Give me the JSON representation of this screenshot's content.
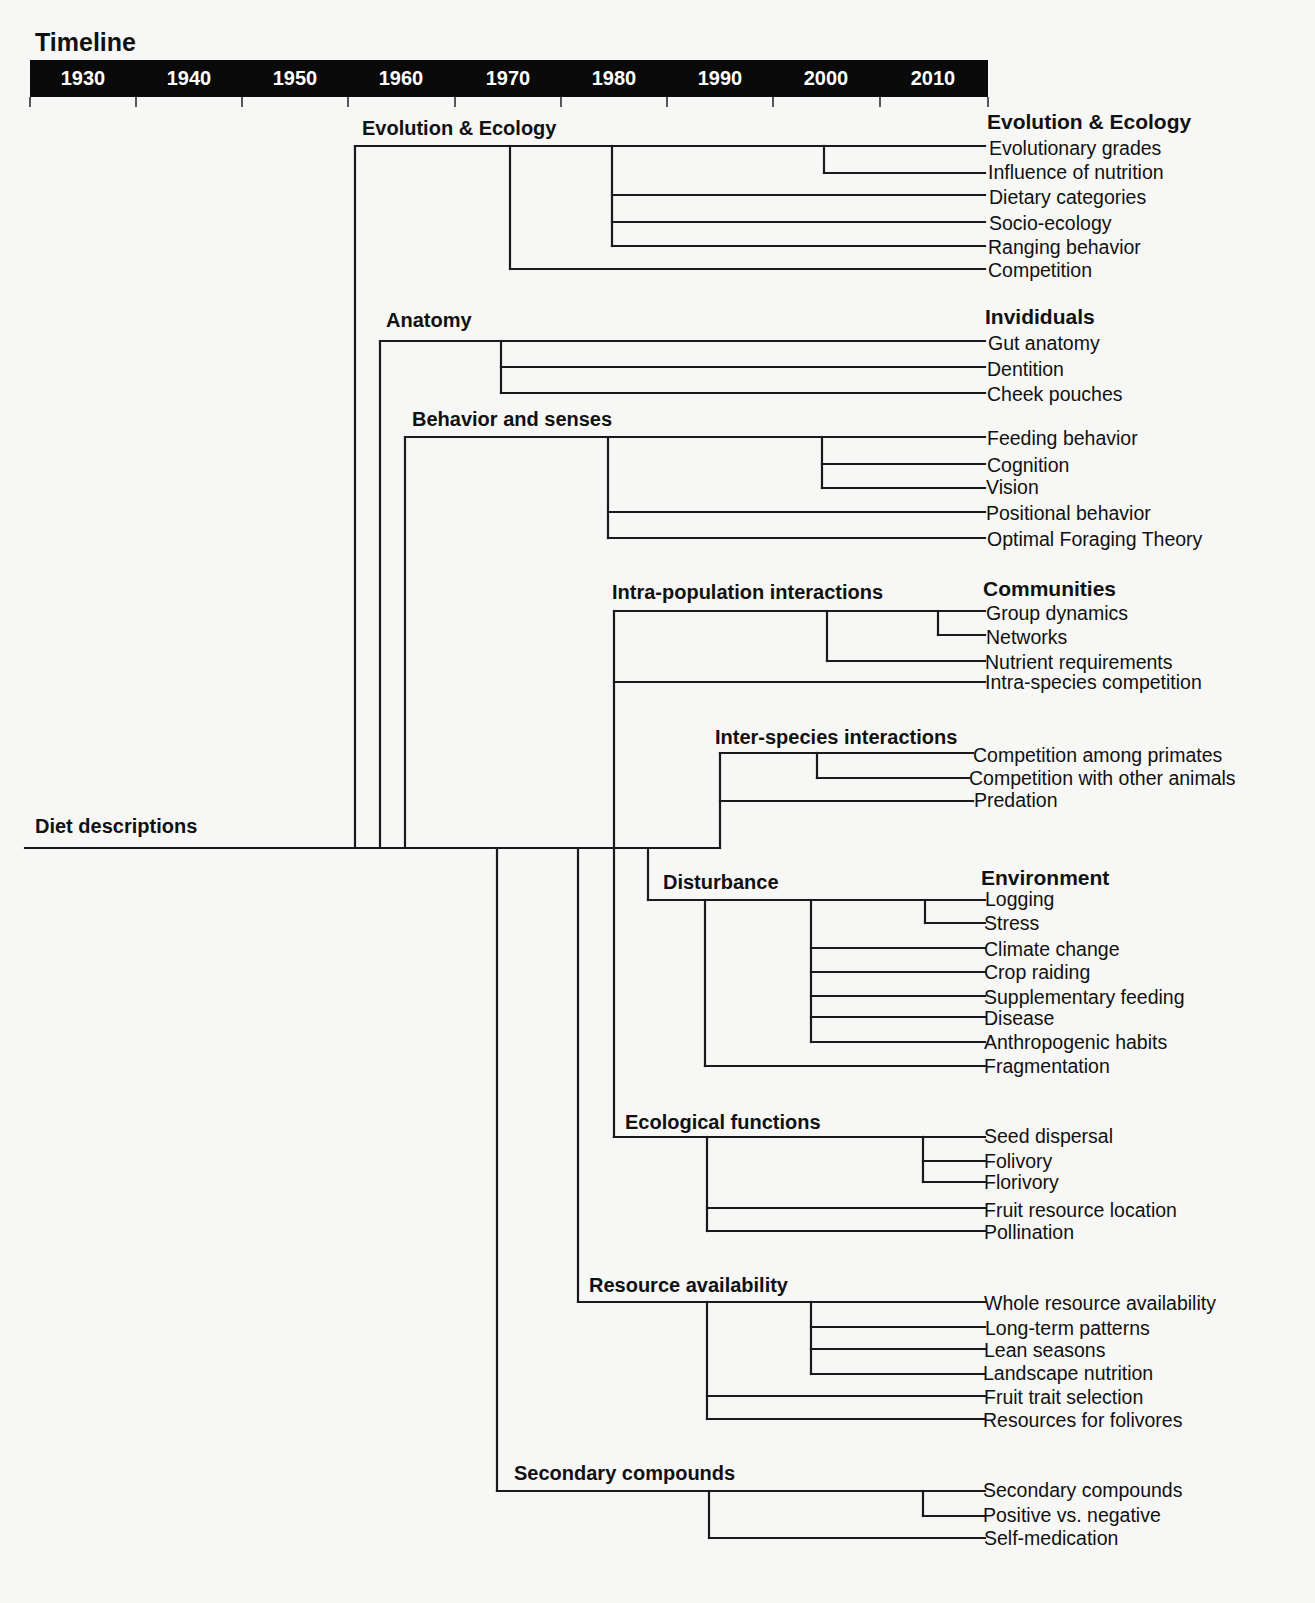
{
  "timeline": {
    "title": "Timeline",
    "bar": {
      "x1": 30,
      "x2": 988,
      "y1": 60,
      "y2": 97,
      "color": "#0a0a0a"
    },
    "years": [
      {
        "label": "1930",
        "x": 83
      },
      {
        "label": "1940",
        "x": 189
      },
      {
        "label": "1950",
        "x": 295
      },
      {
        "label": "1960",
        "x": 401
      },
      {
        "label": "1970",
        "x": 508
      },
      {
        "label": "1980",
        "x": 614
      },
      {
        "label": "1990",
        "x": 720
      },
      {
        "label": "2000",
        "x": 826
      },
      {
        "label": "2010",
        "x": 933
      }
    ],
    "ticks": [
      30,
      136,
      242,
      348,
      455,
      561,
      667,
      773,
      880,
      988
    ]
  },
  "root": {
    "label": "Diet descriptions",
    "x": 35,
    "y": 816
  },
  "categories": [
    {
      "label": "Evolution & Ecology",
      "x": 987,
      "y": 111
    },
    {
      "label": "Invididuals",
      "x": 985,
      "y": 306
    },
    {
      "label": "Communities",
      "x": 983,
      "y": 578
    },
    {
      "label": "Environment",
      "x": 981,
      "y": 867
    }
  ],
  "branches": [
    {
      "label": "Evolution & Ecology",
      "x": 362,
      "y": 118
    },
    {
      "label": "Anatomy",
      "x": 386,
      "y": 310
    },
    {
      "label": "Behavior and senses",
      "x": 412,
      "y": 409
    },
    {
      "label": "Intra-population interactions",
      "x": 612,
      "y": 582
    },
    {
      "label": "Inter-species interactions",
      "x": 715,
      "y": 727
    },
    {
      "label": "Disturbance",
      "x": 663,
      "y": 872
    },
    {
      "label": "Ecological functions",
      "x": 625,
      "y": 1112
    },
    {
      "label": "Resource availability",
      "x": 589,
      "y": 1275
    },
    {
      "label": "Secondary compounds",
      "x": 514,
      "y": 1463
    }
  ],
  "leaves": [
    {
      "label": "Evolutionary grades",
      "x": 989,
      "y": 139
    },
    {
      "label": "Influence of nutrition",
      "x": 988,
      "y": 163
    },
    {
      "label": "Dietary categories",
      "x": 989,
      "y": 188
    },
    {
      "label": "Socio-ecology",
      "x": 989,
      "y": 214
    },
    {
      "label": "Ranging behavior",
      "x": 988,
      "y": 238
    },
    {
      "label": "Competition",
      "x": 988,
      "y": 261
    },
    {
      "label": "Gut anatomy",
      "x": 988,
      "y": 334
    },
    {
      "label": "Dentition",
      "x": 987,
      "y": 360
    },
    {
      "label": "Cheek pouches",
      "x": 987,
      "y": 385
    },
    {
      "label": "Feeding behavior",
      "x": 987,
      "y": 429
    },
    {
      "label": "Cognition",
      "x": 987,
      "y": 456
    },
    {
      "label": "Vision",
      "x": 986,
      "y": 478
    },
    {
      "label": "Positional behavior",
      "x": 986,
      "y": 504
    },
    {
      "label": "Optimal Foraging Theory",
      "x": 987,
      "y": 530
    },
    {
      "label": "Group dynamics",
      "x": 986,
      "y": 604
    },
    {
      "label": "Networks",
      "x": 986,
      "y": 628
    },
    {
      "label": "Nutrient requirements",
      "x": 985,
      "y": 653
    },
    {
      "label": "Intra-species competition",
      "x": 985,
      "y": 673
    },
    {
      "label": "Competition among primates",
      "x": 973,
      "y": 746
    },
    {
      "label": "Competition with other animals",
      "x": 969,
      "y": 769
    },
    {
      "label": "Predation",
      "x": 974,
      "y": 791
    },
    {
      "label": "Logging",
      "x": 985,
      "y": 890
    },
    {
      "label": "Stress",
      "x": 984,
      "y": 914
    },
    {
      "label": "Climate change",
      "x": 984,
      "y": 940
    },
    {
      "label": "Crop raiding",
      "x": 984,
      "y": 963
    },
    {
      "label": "Supplementary feeding",
      "x": 984,
      "y": 988
    },
    {
      "label": "Disease",
      "x": 984,
      "y": 1009
    },
    {
      "label": "Anthropogenic habits",
      "x": 984,
      "y": 1033
    },
    {
      "label": "Fragmentation",
      "x": 984,
      "y": 1057
    },
    {
      "label": "Seed dispersal",
      "x": 984,
      "y": 1127
    },
    {
      "label": "Folivory",
      "x": 984,
      "y": 1152
    },
    {
      "label": "Florivory",
      "x": 984,
      "y": 1173
    },
    {
      "label": "Fruit resource location",
      "x": 984,
      "y": 1201
    },
    {
      "label": "Pollination",
      "x": 984,
      "y": 1223
    },
    {
      "label": "Whole resource availability",
      "x": 984,
      "y": 1294
    },
    {
      "label": "Long-term patterns",
      "x": 985,
      "y": 1319
    },
    {
      "label": "Lean seasons",
      "x": 984,
      "y": 1341
    },
    {
      "label": "Landscape nutrition",
      "x": 983,
      "y": 1364
    },
    {
      "label": "Fruit trait selection",
      "x": 984,
      "y": 1388
    },
    {
      "label": "Resources for folivores",
      "x": 983,
      "y": 1411
    },
    {
      "label": "Secondary compounds",
      "x": 983,
      "y": 1481
    },
    {
      "label": "Positive vs. negative",
      "x": 983,
      "y": 1506
    },
    {
      "label": "Self-medication",
      "x": 984,
      "y": 1529
    }
  ],
  "lines": {
    "color": "#1a1a1a",
    "width": 2.2,
    "segments": [
      [
        25,
        848,
        720,
        848
      ],
      [
        355,
        848,
        355,
        146
      ],
      [
        355,
        146,
        985,
        146
      ],
      [
        510,
        146,
        510,
        269
      ],
      [
        510,
        269,
        985,
        269
      ],
      [
        612,
        146,
        612,
        246
      ],
      [
        612,
        195,
        985,
        195
      ],
      [
        612,
        222,
        985,
        222
      ],
      [
        612,
        246,
        985,
        246
      ],
      [
        824,
        146,
        824,
        173
      ],
      [
        824,
        173,
        985,
        173
      ],
      [
        380,
        848,
        380,
        341
      ],
      [
        380,
        341,
        985,
        341
      ],
      [
        501,
        341,
        501,
        393
      ],
      [
        501,
        367,
        985,
        367
      ],
      [
        501,
        393,
        985,
        393
      ],
      [
        405,
        848,
        405,
        437
      ],
      [
        405,
        437,
        985,
        437
      ],
      [
        608,
        437,
        608,
        538
      ],
      [
        608,
        512,
        985,
        512
      ],
      [
        608,
        538,
        985,
        538
      ],
      [
        822,
        437,
        822,
        488
      ],
      [
        822,
        464,
        985,
        464
      ],
      [
        822,
        488,
        985,
        488
      ],
      [
        614,
        848,
        614,
        611
      ],
      [
        614,
        611,
        985,
        611
      ],
      [
        614,
        682,
        985,
        682
      ],
      [
        827,
        611,
        827,
        661
      ],
      [
        827,
        661,
        985,
        661
      ],
      [
        938,
        611,
        938,
        635
      ],
      [
        938,
        635,
        985,
        635
      ],
      [
        720,
        848,
        720,
        753
      ],
      [
        720,
        753,
        973,
        753
      ],
      [
        720,
        801,
        973,
        801
      ],
      [
        817,
        753,
        817,
        778
      ],
      [
        817,
        778,
        969,
        778
      ],
      [
        648,
        848,
        648,
        900
      ],
      [
        648,
        900,
        985,
        900
      ],
      [
        705,
        900,
        705,
        1066
      ],
      [
        705,
        1066,
        985,
        1066
      ],
      [
        811,
        900,
        811,
        1042
      ],
      [
        811,
        948,
        985,
        948
      ],
      [
        811,
        972,
        985,
        972
      ],
      [
        811,
        996,
        985,
        996
      ],
      [
        811,
        1017,
        985,
        1017
      ],
      [
        811,
        1042,
        985,
        1042
      ],
      [
        925,
        900,
        925,
        923
      ],
      [
        925,
        923,
        985,
        923
      ],
      [
        614,
        848,
        614,
        1137
      ],
      [
        614,
        1137,
        985,
        1137
      ],
      [
        707,
        1137,
        707,
        1231
      ],
      [
        707,
        1208,
        985,
        1208
      ],
      [
        707,
        1231,
        985,
        1231
      ],
      [
        923,
        1137,
        923,
        1182
      ],
      [
        923,
        1161,
        985,
        1161
      ],
      [
        923,
        1182,
        985,
        1182
      ],
      [
        578,
        848,
        578,
        1302
      ],
      [
        578,
        1302,
        985,
        1302
      ],
      [
        707,
        1302,
        707,
        1419
      ],
      [
        707,
        1396,
        985,
        1396
      ],
      [
        707,
        1419,
        985,
        1419
      ],
      [
        811,
        1302,
        811,
        1374
      ],
      [
        811,
        1327,
        985,
        1327
      ],
      [
        811,
        1349,
        985,
        1349
      ],
      [
        811,
        1374,
        985,
        1374
      ],
      [
        497,
        848,
        497,
        1491
      ],
      [
        497,
        1491,
        985,
        1491
      ],
      [
        709,
        1491,
        709,
        1538
      ],
      [
        709,
        1538,
        985,
        1538
      ],
      [
        923,
        1491,
        923,
        1516
      ],
      [
        923,
        1516,
        985,
        1516
      ]
    ]
  }
}
